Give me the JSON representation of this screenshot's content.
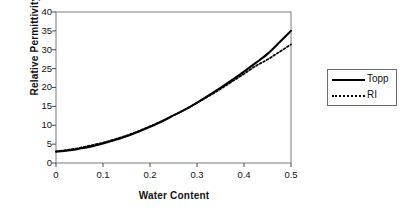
{
  "chart_data": {
    "type": "line",
    "title": "",
    "xlabel": "Water Content",
    "ylabel": "Relative Permittivity",
    "xlim": [
      0,
      0.5
    ],
    "ylim": [
      0,
      40
    ],
    "xticks": [
      "0",
      "0.1",
      "0.2",
      "0.3",
      "0.4",
      "0.5"
    ],
    "yticks": [
      "0",
      "5",
      "10",
      "15",
      "20",
      "25",
      "30",
      "35",
      "40"
    ],
    "grid": false,
    "legend_position": "right",
    "x": [
      0,
      0.025,
      0.05,
      0.075,
      0.1,
      0.125,
      0.15,
      0.175,
      0.2,
      0.225,
      0.25,
      0.275,
      0.3,
      0.325,
      0.35,
      0.375,
      0.4,
      0.425,
      0.45,
      0.475,
      0.5
    ],
    "series": [
      {
        "name": "Topp",
        "style": "solid",
        "color": "#000000",
        "values": [
          3.0,
          3.3,
          3.8,
          4.4,
          5.2,
          6.1,
          7.1,
          8.3,
          9.6,
          11.0,
          12.6,
          14.2,
          16.0,
          17.9,
          19.9,
          22.0,
          24.2,
          26.5,
          28.9,
          31.9,
          35.0
        ]
      },
      {
        "name": "RI",
        "style": "dotted",
        "color": "#000000",
        "values": [
          3.1,
          3.5,
          4.0,
          4.7,
          5.4,
          6.3,
          7.3,
          8.4,
          9.7,
          11.1,
          12.6,
          14.2,
          15.9,
          17.7,
          19.6,
          21.6,
          23.6,
          25.7,
          27.4,
          29.4,
          31.4
        ]
      }
    ]
  },
  "legend": {
    "entries": [
      {
        "label": "Topp"
      },
      {
        "label": "RI"
      }
    ]
  }
}
